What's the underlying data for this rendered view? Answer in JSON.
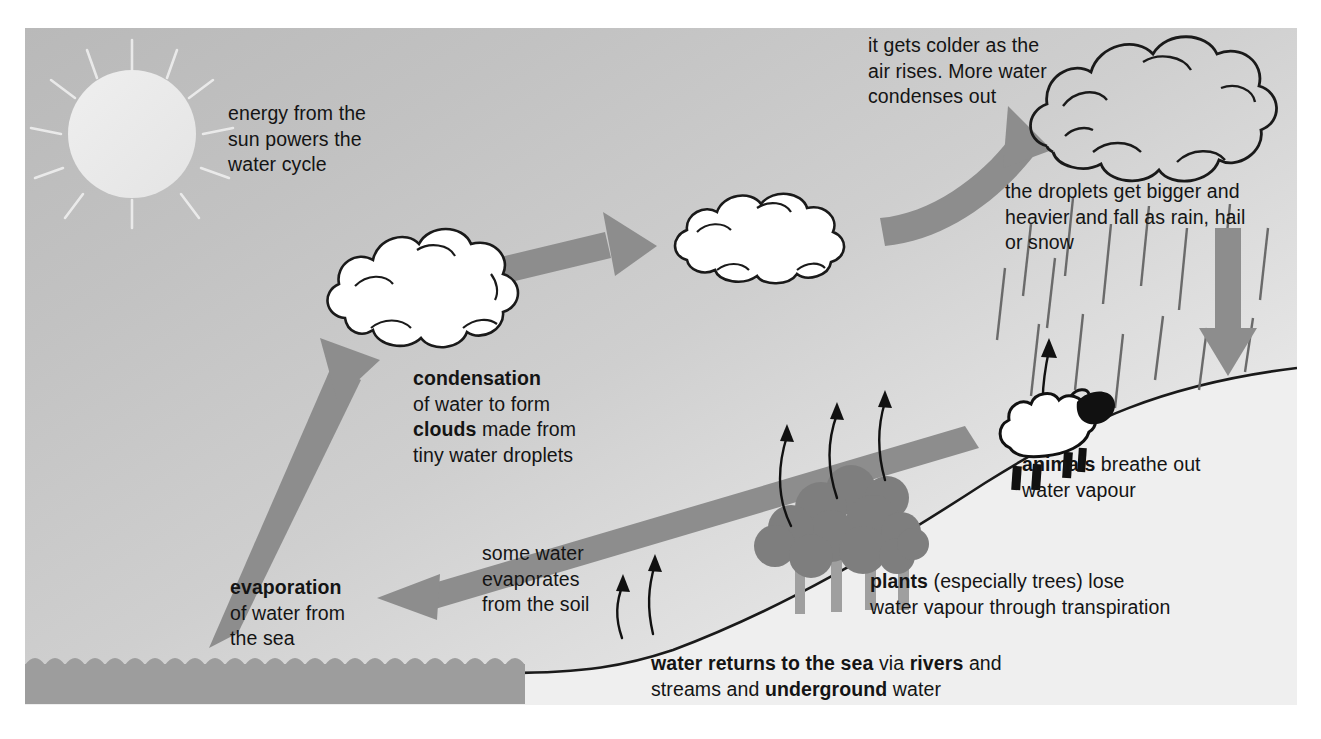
{
  "diagram": {
    "title": "the water cycle",
    "type": "water-cycle-diagram",
    "colors": {
      "background_top_left": "#b9b9b9",
      "background_bottom_right": "#fafafa",
      "arrow_gray": "#8a8a8a",
      "sea_gray": "#9a9a9a",
      "tree_gray": "#7d7d7d",
      "cloud_white": "#ffffff",
      "outline_black": "#1a1a1a",
      "text_black": "#141414",
      "sun_pale": "#ececec"
    }
  },
  "labels": {
    "sun": {
      "name": "energy-from-sun-label",
      "lines": [
        "energy from the",
        "sun powers the",
        "water cycle"
      ]
    },
    "colder": {
      "name": "colder-as-air-rises-label",
      "lines": [
        "it gets colder as the",
        "air rises. More water",
        "condenses out"
      ]
    },
    "droplets": {
      "name": "droplets-fall-label",
      "lines": [
        "the droplets get bigger and",
        "heavier and fall as rain, hail",
        "or snow"
      ]
    },
    "condensation": {
      "name": "condensation-label",
      "line1_bold": "condensation",
      "line2": "of water to form",
      "line3_bold": "clouds",
      "line3_rest": " made from",
      "line4": "tiny water droplets"
    },
    "animals": {
      "name": "animals-label",
      "line1_bold": "animals",
      "line1_rest": " breathe out",
      "line2": "water vapour"
    },
    "some_water": {
      "name": "soil-evaporation-label",
      "lines": [
        "some water",
        "evaporates",
        "from the soil"
      ]
    },
    "plants": {
      "name": "plants-transpiration-label",
      "line1_bold": "plants",
      "line1_rest": " (especially trees) lose",
      "line2": "water vapour through transpiration"
    },
    "evaporation": {
      "name": "evaporation-label",
      "line1_bold": "evaporation",
      "line2": "of water from",
      "line3": "the sea"
    },
    "returns": {
      "name": "water-returns-label",
      "line1_bold_a": "water returns to the sea",
      "line1_mid": " via ",
      "line1_bold_b": "rivers",
      "line1_end": " and",
      "line2_start": "streams and ",
      "line2_bold": "underground",
      "line2_end": " water"
    }
  },
  "elements": {
    "sun": "sun-with-rays",
    "cloud_small": "condensation-cloud",
    "cloud_mid": "rising-cloud",
    "cloud_rain": "rain-cloud",
    "sheep": "sheep-animal",
    "trees": "tree-cluster",
    "sea": "sea-with-waves",
    "hill": "hill-slope",
    "rain": "rain-streaks",
    "arrows": [
      "evaporation-arrow-up",
      "condensation-arrow-right",
      "rising-air-arrow",
      "rainfall-arrow-down",
      "runoff-arrow-left",
      "transpiration-arrows",
      "soil-evaporation-arrows",
      "sheep-breath-arrow"
    ]
  }
}
